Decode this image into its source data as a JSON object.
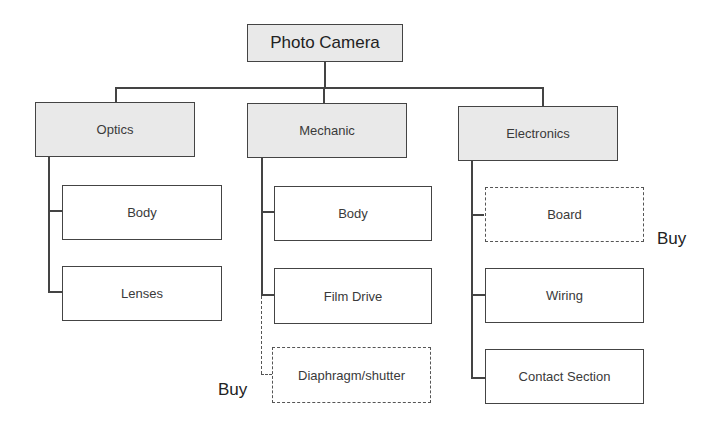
{
  "diagram": {
    "type": "hierarchy-tree",
    "root": {
      "label": "Photo Camera"
    },
    "groups": [
      {
        "label": "Optics",
        "children": [
          {
            "label": "Body",
            "style": "solid"
          },
          {
            "label": "Lenses",
            "style": "solid"
          }
        ]
      },
      {
        "label": "Mechanic",
        "children": [
          {
            "label": "Body",
            "style": "solid"
          },
          {
            "label": "Film Drive",
            "style": "solid"
          },
          {
            "label": "Diaphragm/shutter",
            "style": "dashed",
            "annotation": "Buy"
          }
        ]
      },
      {
        "label": "Electronics",
        "children": [
          {
            "label": "Board",
            "style": "dashed",
            "annotation": "Buy"
          },
          {
            "label": "Wiring",
            "style": "solid"
          },
          {
            "label": "Contact Section",
            "style": "solid"
          }
        ]
      }
    ],
    "annotations": {
      "mechanic_buy": "Buy",
      "electronics_buy": "Buy"
    },
    "colors": {
      "group_fill": "#e9e9e9",
      "line": "#444444",
      "background": "#ffffff"
    }
  }
}
